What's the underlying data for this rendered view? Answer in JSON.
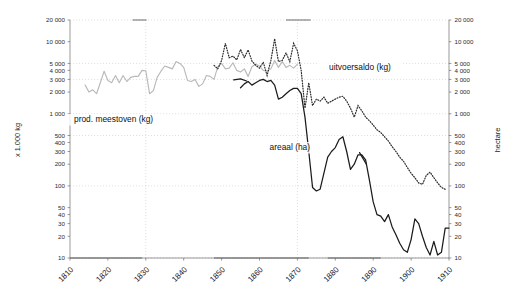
{
  "chart_data": {
    "type": "line",
    "title": "",
    "xlabel": "",
    "ylabel": "x 1.000 kg",
    "ylabel_right": "hectare",
    "yscale": "log",
    "ylim": [
      10,
      20000
    ],
    "xlim": [
      1810,
      1910
    ],
    "grid": true,
    "legend_position": "inline-annotations",
    "xticks": [
      1810,
      1820,
      1830,
      1840,
      1850,
      1860,
      1870,
      1880,
      1890,
      1900,
      1910
    ],
    "yticks": [
      10,
      20,
      30,
      40,
      50,
      100,
      200,
      300,
      400,
      500,
      1000,
      2000,
      3000,
      4000,
      5000,
      10000,
      20000
    ],
    "ytick_labels": [
      "10",
      "20",
      "30",
      "40",
      "50",
      "100",
      "200",
      "300",
      "400",
      "500",
      "1 000",
      "2 000",
      "3 000",
      "4 000",
      "5 000",
      "10 000",
      "20 000"
    ],
    "ytick_labels_right": [
      "10",
      "20",
      "30",
      "40",
      "50",
      "100",
      "200",
      "300",
      "400",
      "500",
      "1 000",
      "2 000",
      "3 000",
      "4 000",
      "5 000",
      "10 000",
      "20 000"
    ],
    "gridlines_y": [
      500,
      1000,
      20000
    ],
    "gridlines_x": [
      1830,
      1870
    ],
    "series": [
      {
        "name": "prod. meestoven (kg)",
        "style": "solid-light",
        "color": "#b9b9b9",
        "annotation": "prod. meestoven (kg)",
        "x": [
          1814,
          1815,
          1816,
          1817,
          1818,
          1819,
          1820,
          1821,
          1822,
          1823,
          1824,
          1825,
          1826,
          1827,
          1828,
          1829,
          1830,
          1831,
          1832,
          1833,
          1834,
          1835,
          1836,
          1837,
          1838,
          1839,
          1840,
          1841,
          1842,
          1843,
          1844,
          1845,
          1846,
          1847,
          1848,
          1849,
          1850,
          1851,
          1852,
          1853,
          1854,
          1855,
          1856,
          1857,
          1858,
          1859,
          1860,
          1861,
          1862,
          1863,
          1864,
          1865,
          1866,
          1867,
          1868,
          1869,
          1870
        ],
        "y": [
          2500,
          2000,
          2150,
          1900,
          2700,
          3900,
          2900,
          2700,
          3400,
          2700,
          3400,
          2800,
          3200,
          3300,
          3300,
          4000,
          3950,
          1900,
          2100,
          3200,
          3900,
          4600,
          4400,
          4200,
          5300,
          5000,
          4400,
          2900,
          2800,
          3000,
          2400,
          2600,
          3400,
          3300,
          3000,
          4500,
          5000,
          4200,
          4300,
          5100,
          4000,
          3800,
          4200,
          3300,
          4500,
          4900,
          4600,
          4000,
          3900,
          4200,
          5500,
          4400,
          5300,
          4400,
          4700,
          4300,
          4900
        ]
      },
      {
        "name": "areaal (ha)",
        "style": "solid-dark",
        "color": "#1b1b1b",
        "annotation": "areaal (ha)",
        "x": [
          1855,
          1856,
          1857,
          1858,
          1859,
          1860,
          1861,
          1862,
          1863,
          1864,
          1865,
          1866,
          1867,
          1868,
          1869,
          1870,
          1871,
          1872,
          1873,
          1874,
          1875,
          1876,
          1877,
          1878,
          1879,
          1880,
          1881,
          1882,
          1883,
          1884,
          1885,
          1886,
          1887,
          1888,
          1889,
          1890,
          1891,
          1892,
          1893,
          1894,
          1895,
          1896,
          1897,
          1898,
          1899,
          1900,
          1901,
          1902,
          1903,
          1904,
          1905,
          1906,
          1907,
          1908,
          1909,
          1910
        ],
        "y": [
          2300,
          2600,
          2800,
          2500,
          2700,
          2900,
          3000,
          2800,
          2900,
          2500,
          1600,
          1700,
          1900,
          2100,
          2250,
          2250,
          1900,
          900,
          300,
          95,
          85,
          90,
          150,
          250,
          300,
          340,
          440,
          480,
          300,
          170,
          200,
          270,
          270,
          230,
          120,
          60,
          40,
          38,
          32,
          40,
          27,
          21,
          16,
          13,
          12,
          18,
          35,
          30,
          20,
          14,
          11,
          17,
          11,
          12,
          26,
          26
        ]
      },
      {
        "name": "uitvoersaldo (kg)",
        "style": "dotted",
        "color": "#2a2a2a",
        "annotation": "uitvoersaldo (kg)",
        "x": [
          1848,
          1849,
          1850,
          1851,
          1852,
          1853,
          1854,
          1855,
          1856,
          1857,
          1858,
          1859,
          1860,
          1861,
          1862,
          1863,
          1864,
          1865,
          1866,
          1867,
          1868,
          1869,
          1870,
          1871,
          1872,
          1873,
          1874,
          1875,
          1876,
          1877,
          1878,
          1879,
          1880,
          1881,
          1882,
          1883,
          1884,
          1885,
          1886,
          1887,
          1888,
          1889,
          1890,
          1891,
          1892,
          1893,
          1894,
          1895,
          1896,
          1897,
          1898,
          1899,
          1900,
          1901,
          1902,
          1903,
          1904,
          1905,
          1906,
          1907,
          1908,
          1909
        ],
        "y": [
          4700,
          4200,
          5500,
          9500,
          6000,
          6300,
          5600,
          7800,
          6000,
          7700,
          5400,
          4700,
          4300,
          5200,
          3400,
          5500,
          11000,
          5300,
          5500,
          7000,
          5300,
          9500,
          7500,
          4000,
          1200,
          2700,
          1300,
          1600,
          1500,
          1700,
          1400,
          1500,
          1600,
          1700,
          1750,
          1500,
          1200,
          900,
          1300,
          1100,
          900,
          800,
          700,
          600,
          550,
          480,
          420,
          350,
          300,
          250,
          220,
          180,
          150,
          130,
          110,
          105,
          140,
          155,
          130,
          110,
          95,
          90
        ]
      }
    ],
    "annotations": [
      {
        "text": "prod. meestoven (kg)",
        "x": 1821.5,
        "y_px": 122
      },
      {
        "text": "uitvoersaldo (kg)",
        "x": 1886.5,
        "y_px": 70
      },
      {
        "text": "areaal (ha)",
        "x": 1868.0,
        "y_px": 150
      }
    ]
  }
}
